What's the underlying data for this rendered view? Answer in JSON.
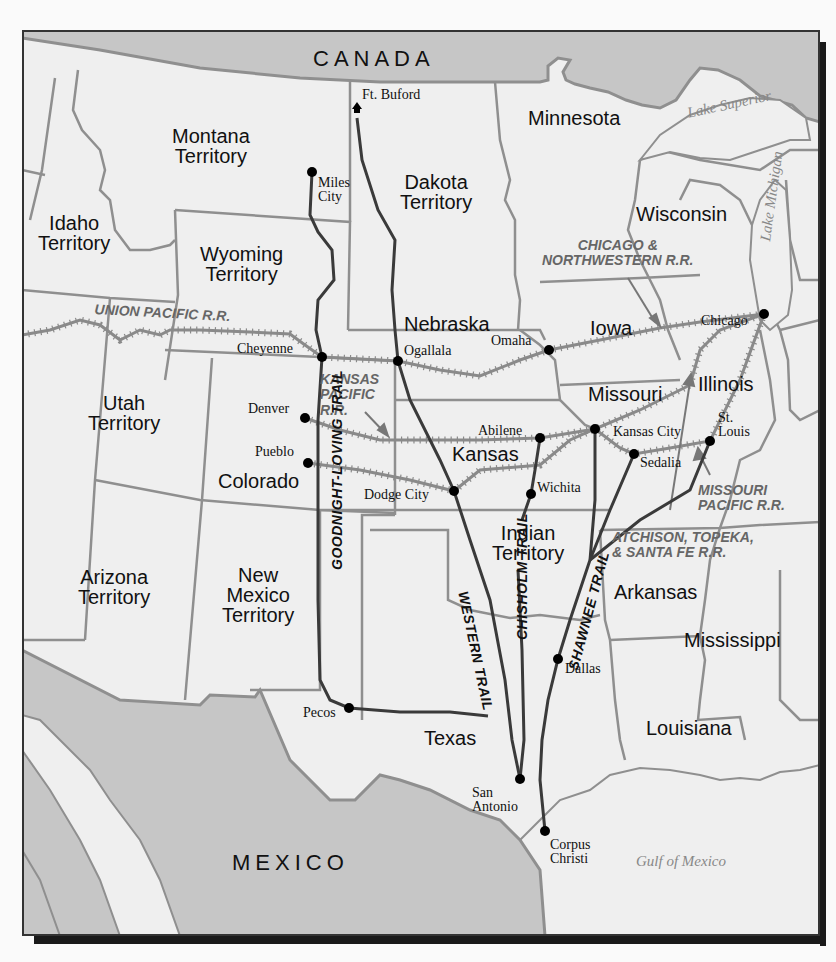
{
  "colors": {
    "land": "#efefef",
    "foreign": "#c6c6c6",
    "border": "#8f8f8f",
    "trail": "#3a3a3a",
    "railroad": "#7a7a7a",
    "city_dot": "#000000",
    "frame": "#333333"
  },
  "countries": [
    {
      "name": "CANADA",
      "x": 313,
      "y": 48
    },
    {
      "name": "MEXICO",
      "x": 232,
      "y": 852
    }
  ],
  "regions": [
    {
      "id": "montana",
      "lines": [
        "Montana",
        "Territory"
      ],
      "x": 172,
      "y": 126
    },
    {
      "id": "idaho",
      "lines": [
        "Idaho",
        "Territory"
      ],
      "x": 38,
      "y": 213
    },
    {
      "id": "wyoming",
      "lines": [
        "Wyoming",
        "Territory"
      ],
      "x": 200,
      "y": 244
    },
    {
      "id": "dakota",
      "lines": [
        "Dakota",
        "Territory"
      ],
      "x": 400,
      "y": 172
    },
    {
      "id": "minnesota",
      "lines": [
        "Minnesota"
      ],
      "x": 528,
      "y": 108
    },
    {
      "id": "wisconsin",
      "lines": [
        "Wisconsin"
      ],
      "x": 636,
      "y": 204
    },
    {
      "id": "nebraska",
      "lines": [
        "Nebraska"
      ],
      "x": 404,
      "y": 314
    },
    {
      "id": "iowa",
      "lines": [
        "Iowa"
      ],
      "x": 590,
      "y": 318
    },
    {
      "id": "utah",
      "lines": [
        "Utah",
        "Territory"
      ],
      "x": 88,
      "y": 393
    },
    {
      "id": "missouri",
      "lines": [
        "Missouri"
      ],
      "x": 588,
      "y": 384
    },
    {
      "id": "illinois",
      "lines": [
        "Illinois"
      ],
      "x": 698,
      "y": 374
    },
    {
      "id": "kansas",
      "lines": [
        "Kansas"
      ],
      "x": 452,
      "y": 444
    },
    {
      "id": "colorado",
      "lines": [
        "Colorado"
      ],
      "x": 218,
      "y": 471
    },
    {
      "id": "indian",
      "lines": [
        "Indian",
        "Territory"
      ],
      "x": 492,
      "y": 523
    },
    {
      "id": "arkansas",
      "lines": [
        "Arkansas"
      ],
      "x": 614,
      "y": 582
    },
    {
      "id": "arizona",
      "lines": [
        "Arizona",
        "Territory"
      ],
      "x": 78,
      "y": 567
    },
    {
      "id": "new_mexico",
      "lines": [
        "New",
        "Mexico",
        "Territory"
      ],
      "x": 222,
      "y": 565
    },
    {
      "id": "mississippi",
      "lines": [
        "Mississippi"
      ],
      "x": 684,
      "y": 630
    },
    {
      "id": "louisiana",
      "lines": [
        "Louisiana"
      ],
      "x": 646,
      "y": 718
    },
    {
      "id": "texas",
      "lines": [
        "Texas"
      ],
      "x": 424,
      "y": 728
    }
  ],
  "water": [
    {
      "name": "Lake Superior",
      "x": 686,
      "y": 106,
      "rotate": -12
    },
    {
      "name": "Lake Michigan",
      "x": 758,
      "y": 240,
      "rotate": -82
    },
    {
      "name": "Gulf of Mexico",
      "x": 636,
      "y": 854,
      "rotate": 0
    }
  ],
  "cities": [
    {
      "name": "Ft. Buford",
      "lines": [
        "Ft. Buford"
      ],
      "dot": [
        357,
        110
      ],
      "marker": "fort",
      "lx": 362,
      "ly": 88
    },
    {
      "name": "Miles City",
      "lines": [
        "Miles",
        "City"
      ],
      "dot": [
        312,
        172
      ],
      "lx": 318,
      "ly": 176
    },
    {
      "name": "Cheyenne",
      "lines": [
        "Cheyenne"
      ],
      "dot": [
        322,
        357
      ],
      "lx": 237,
      "ly": 342
    },
    {
      "name": "Ogallala",
      "lines": [
        "Ogallala"
      ],
      "dot": [
        398,
        361
      ],
      "lx": 404,
      "ly": 344
    },
    {
      "name": "Omaha",
      "lines": [
        "Omaha"
      ],
      "dot": [
        549,
        350
      ],
      "lx": 491,
      "ly": 334
    },
    {
      "name": "Chicago",
      "lines": [
        "Chicago"
      ],
      "dot": [
        764,
        314
      ],
      "lx": 701,
      "ly": 314
    },
    {
      "name": "Denver",
      "lines": [
        "Denver"
      ],
      "dot": [
        305,
        418
      ],
      "lx": 248,
      "ly": 402
    },
    {
      "name": "Pueblo",
      "lines": [
        "Pueblo"
      ],
      "dot": [
        308,
        463
      ],
      "lx": 255,
      "ly": 445
    },
    {
      "name": "Abilene",
      "lines": [
        "Abilene"
      ],
      "dot": [
        540,
        438
      ],
      "lx": 478,
      "ly": 424
    },
    {
      "name": "Kansas City",
      "lines": [
        "Kansas City"
      ],
      "dot": [
        595,
        429
      ],
      "lx": 613,
      "ly": 425
    },
    {
      "name": "St. Louis",
      "lines": [
        "St.",
        "Louis"
      ],
      "dot": [
        710,
        441
      ],
      "lx": 718,
      "ly": 411
    },
    {
      "name": "Sedalia",
      "lines": [
        "Sedalia"
      ],
      "dot": [
        634,
        454
      ],
      "lx": 640,
      "ly": 456
    },
    {
      "name": "Dodge City",
      "lines": [
        "Dodge City"
      ],
      "dot": [
        454,
        491
      ],
      "lx": 364,
      "ly": 488
    },
    {
      "name": "Wichita",
      "lines": [
        "Wichita"
      ],
      "dot": [
        531,
        494
      ],
      "lx": 537,
      "ly": 481
    },
    {
      "name": "Pecos",
      "lines": [
        "Pecos"
      ],
      "dot": [
        349,
        708
      ],
      "lx": 303,
      "ly": 706
    },
    {
      "name": "Dallas",
      "lines": [
        "Dallas"
      ],
      "dot": [
        558,
        659
      ],
      "lx": 565,
      "ly": 662
    },
    {
      "name": "San Antonio",
      "lines": [
        "San",
        "Antonio"
      ],
      "dot": [
        520,
        779
      ],
      "lx": 472,
      "ly": 786
    },
    {
      "name": "Corpus Christi",
      "lines": [
        "Corpus",
        "Christi"
      ],
      "dot": [
        545,
        831
      ],
      "lx": 550,
      "ly": 838
    }
  ],
  "railroads": [
    {
      "id": "union_pacific",
      "label_lines": [
        "UNION PACIFIC R.R."
      ],
      "lx": 95,
      "ly": 302,
      "rotate": 3
    },
    {
      "id": "kansas_pacific",
      "label_lines": [
        "KANSAS",
        "PACIFIC",
        "R.R."
      ],
      "lx": 320,
      "ly": 372,
      "rotate": 0
    },
    {
      "id": "chicago_northwestern",
      "label_lines": [
        "CHICAGO &",
        "NORTHWESTERN R.R."
      ],
      "lx": 542,
      "ly": 238,
      "rotate": 0,
      "align": "center"
    },
    {
      "id": "missouri_pacific",
      "label_lines": [
        "MISSOURI",
        "PACIFIC R.R."
      ],
      "lx": 698,
      "ly": 483,
      "rotate": 0
    },
    {
      "id": "atchison_topeka",
      "label_lines": [
        "ATCHISON, TOPEKA,",
        "& SANTA FE R.R."
      ],
      "lx": 612,
      "ly": 530,
      "rotate": 0
    }
  ],
  "trails": [
    {
      "id": "goodnight_loving",
      "label": "GOODNIGHT-LOVING TRAIL",
      "lx": 330,
      "ly": 570,
      "rotate": -90
    },
    {
      "id": "western",
      "label": "WESTERN TRAIL",
      "lx": 470,
      "ly": 590,
      "rotate": 78
    },
    {
      "id": "chisholm",
      "label": "CHISHOLM TRAIL",
      "lx": 515,
      "ly": 640,
      "rotate": -90
    },
    {
      "id": "shawnee",
      "label": "SHAWNEE TRAIL",
      "lx": 566,
      "ly": 668,
      "rotate": -75
    }
  ]
}
